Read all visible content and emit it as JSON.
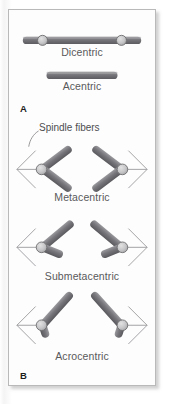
{
  "figure": {
    "panels": [
      {
        "letter": "A",
        "items": [
          {
            "id": "dicentric",
            "label": "Dicentric",
            "centromeres": 2,
            "shape": "rod"
          },
          {
            "id": "acentric",
            "label": "Acentric",
            "centromeres": 0,
            "shape": "rod"
          }
        ]
      },
      {
        "letter": "B",
        "annotation": "Spindle fibers",
        "items": [
          {
            "id": "metacentric",
            "label": "Metacentric",
            "centromeres": 1,
            "shape": "v-pair",
            "arm_ratio": "equal"
          },
          {
            "id": "submetacentric",
            "label": "Submetacentric",
            "centromeres": 1,
            "shape": "v-pair",
            "arm_ratio": "unequal"
          },
          {
            "id": "acrocentric",
            "label": "Acrocentric",
            "centromeres": 1,
            "shape": "v-pair",
            "arm_ratio": "very-unequal"
          }
        ]
      }
    ],
    "colors": {
      "chromatid_arm": "#7b7b7f",
      "chromatid_arm_dark": "#5d5d61",
      "centromere_fill": "#c3c3c5",
      "centromere_stroke": "#6d6d70",
      "spindle_fiber": "#8d8d90",
      "caption_text": "#59595b",
      "panel_border": "#b9b9b9",
      "panel_background": "#fdfdfd"
    }
  }
}
